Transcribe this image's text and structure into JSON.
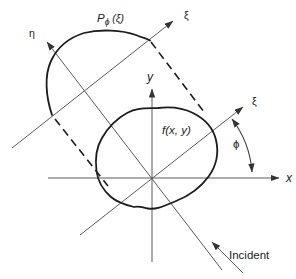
{
  "labels": {
    "projection": {
      "p": "P",
      "sub": "ϕ",
      "arg": " (ξ)"
    },
    "xi_projection_axis": "ξ",
    "xi_axis": "ξ",
    "eta_axis": "η",
    "x_axis": "x",
    "y_axis": "y",
    "phi_angle": "ϕ",
    "object_function": "f(x, y)",
    "incident": "Incident"
  },
  "colors": {
    "background": "#ffffff",
    "thin_line": "#5a5a5a",
    "curve": "#1c1c1c",
    "text": "#222222",
    "arrowhead": "#333333"
  }
}
